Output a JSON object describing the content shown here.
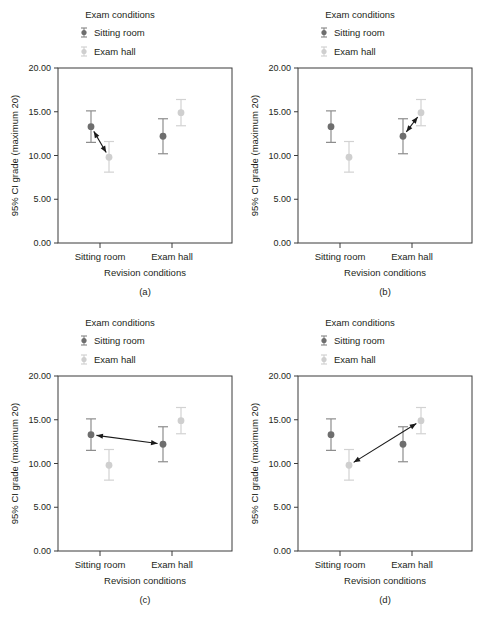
{
  "figure": {
    "panels": [
      "a",
      "b",
      "c",
      "d"
    ]
  },
  "labels": {
    "legend_title": "Exam conditions",
    "legend_sitting_room": "Sitting room",
    "legend_exam_hall": "Exam hall",
    "y_axis_title": "95% CI grade (maximum 20)",
    "x_axis_title": "Revision conditions",
    "cat_sitting_room": "Sitting room",
    "cat_exam_hall": "Exam hall",
    "caption_a": "(a)",
    "caption_b": "(b)",
    "caption_c": "(c)",
    "caption_d": "(d)",
    "ytick_0": "0.00",
    "ytick_5": "5.00",
    "ytick_10": "10.00",
    "ytick_15": "15.00",
    "ytick_20": "20.00"
  },
  "colors": {
    "sitting_room": "#6e6e6e",
    "exam_hall": "#cfcfcf",
    "sitting_room_errorbar": "#8d8d8d",
    "exam_hall_errorbar": "#d2d2d2",
    "frame": "#3b3b3b",
    "arrow": "#1a1a1a",
    "text": "#231f20",
    "background": "#ffffff"
  },
  "chart_data": {
    "type": "scatter",
    "title": "",
    "xlabel": "Revision conditions",
    "ylabel": "95% CI grade (maximum 20)",
    "legend_title": "Exam conditions",
    "legend_position": "top",
    "grid": false,
    "ylim": [
      0,
      20
    ],
    "yticks": [
      0,
      5,
      10,
      15,
      20
    ],
    "ytick_labels": [
      "0.00",
      "5.00",
      "10.00",
      "15.00",
      "20.00"
    ],
    "categories": [
      "Sitting room",
      "Exam hall"
    ],
    "series": [
      {
        "name": "Sitting room",
        "color": "#6e6e6e",
        "values": [
          13.3,
          12.2
        ],
        "ci_lower": [
          11.5,
          10.2
        ],
        "ci_upper": [
          15.1,
          14.2
        ]
      },
      {
        "name": "Exam hall",
        "color": "#cfcfcf",
        "values": [
          9.8,
          14.9
        ],
        "ci_lower": [
          8.1,
          13.4
        ],
        "ci_upper": [
          11.6,
          16.4
        ]
      }
    ],
    "panels": [
      {
        "id": "a",
        "caption": "(a)",
        "annotation": {
          "type": "double-headed-arrow",
          "from": {
            "category": "Sitting room",
            "series": "Sitting room",
            "value": 13.3
          },
          "to": {
            "category": "Sitting room",
            "series": "Exam hall",
            "value": 9.8
          },
          "describes": "simple effect of exam conditions within sitting room revision"
        }
      },
      {
        "id": "b",
        "caption": "(b)",
        "annotation": {
          "type": "double-headed-arrow",
          "from": {
            "category": "Exam hall",
            "series": "Sitting room",
            "value": 12.2
          },
          "to": {
            "category": "Exam hall",
            "series": "Exam hall",
            "value": 14.9
          },
          "describes": "simple effect of exam conditions within exam hall revision"
        }
      },
      {
        "id": "c",
        "caption": "(c)",
        "annotation": {
          "type": "double-headed-arrow",
          "from": {
            "category": "Sitting room",
            "series": "Sitting room",
            "value": 13.3
          },
          "to": {
            "category": "Exam hall",
            "series": "Sitting room",
            "value": 12.2
          },
          "describes": "simple effect of revision conditions within sitting room exam"
        }
      },
      {
        "id": "d",
        "caption": "(d)",
        "annotation": {
          "type": "double-headed-arrow",
          "from": {
            "category": "Sitting room",
            "series": "Exam hall",
            "value": 9.8
          },
          "to": {
            "category": "Exam hall",
            "series": "Exam hall",
            "value": 14.9
          },
          "describes": "simple effect of revision conditions within exam hall exam"
        }
      }
    ]
  }
}
